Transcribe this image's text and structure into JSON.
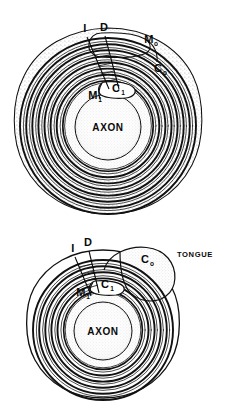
{
  "figure": {
    "stroke_color": "#111111",
    "stipple_color": "#b9b9b9",
    "background": "#ffffff",
    "panels": [
      {
        "id": "upper-fiber",
        "name": "upper-myelinated-fiber",
        "center": {
          "x": 108,
          "y": 124
        },
        "lamella_count": 9,
        "labels": [
          {
            "key": "I",
            "text": "I",
            "sub": "",
            "x": 85,
            "y": 32,
            "kind": "letter",
            "leader": {
              "x1": 87,
              "y1": 36,
              "x2": 108,
              "y2": 88
            }
          },
          {
            "key": "D",
            "text": "D",
            "sub": "",
            "x": 104,
            "y": 31,
            "kind": "letter",
            "leader": {
              "x1": 105,
              "y1": 35,
              "x2": 117,
              "y2": 88
            }
          },
          {
            "key": "Mo",
            "text": "M",
            "sub": "o",
            "x": 149,
            "y": 43,
            "kind": "letter-sub"
          },
          {
            "key": "Co",
            "text": "C",
            "sub": "o",
            "x": 158,
            "y": 72,
            "kind": "letter-sub"
          },
          {
            "key": "M1",
            "text": "M",
            "sub": "1",
            "x": 93,
            "y": 99,
            "kind": "letter-sub"
          },
          {
            "key": "C1",
            "text": "C",
            "sub": "1",
            "x": 116,
            "y": 92,
            "kind": "letter-sub"
          },
          {
            "key": "AXON",
            "text": "AXON",
            "sub": "",
            "x": 108,
            "y": 133,
            "kind": "word-cap"
          }
        ]
      },
      {
        "id": "lower-fiber",
        "name": "lower-myelinated-fiber",
        "center": {
          "x": 103,
          "y": 327
        },
        "lamella_count": 8,
        "labels": [
          {
            "key": "I",
            "text": "I",
            "sub": "",
            "x": 73,
            "y": 252,
            "kind": "letter",
            "leader": {
              "x1": 75,
              "y1": 256,
              "x2": 90,
              "y2": 292
            }
          },
          {
            "key": "D",
            "text": "D",
            "sub": "",
            "x": 87,
            "y": 246,
            "kind": "letter",
            "leader": {
              "x1": 89,
              "y1": 250,
              "x2": 98,
              "y2": 292
            }
          },
          {
            "key": "Co",
            "text": "C",
            "sub": "o",
            "x": 145,
            "y": 263,
            "kind": "letter-sub"
          },
          {
            "key": "M1",
            "text": "M",
            "sub": "1",
            "x": 81,
            "y": 296,
            "kind": "letter-sub"
          },
          {
            "key": "C1",
            "text": "C",
            "sub": "1",
            "x": 105,
            "y": 288,
            "kind": "letter-sub"
          },
          {
            "key": "TONGUE",
            "text": "TONGUE",
            "sub": "",
            "x": 195,
            "y": 254,
            "kind": "word-small"
          },
          {
            "key": "AXON",
            "text": "AXON",
            "sub": "",
            "x": 103,
            "y": 334,
            "kind": "word-cap"
          }
        ]
      }
    ],
    "legend_keys": [
      {
        "symbol": "I",
        "meaning": "intraperiod line"
      },
      {
        "symbol": "D",
        "meaning": "dense line"
      },
      {
        "symbol": "Mo",
        "meaning": "outer mesaxon"
      },
      {
        "symbol": "M1",
        "meaning": "inner mesaxon"
      },
      {
        "symbol": "Co",
        "meaning": "outer cytoplasm"
      },
      {
        "symbol": "C1",
        "meaning": "inner cytoplasm"
      },
      {
        "symbol": "AXON",
        "meaning": "axon"
      },
      {
        "symbol": "TONGUE",
        "meaning": "cytoplasmic tongue"
      }
    ]
  }
}
